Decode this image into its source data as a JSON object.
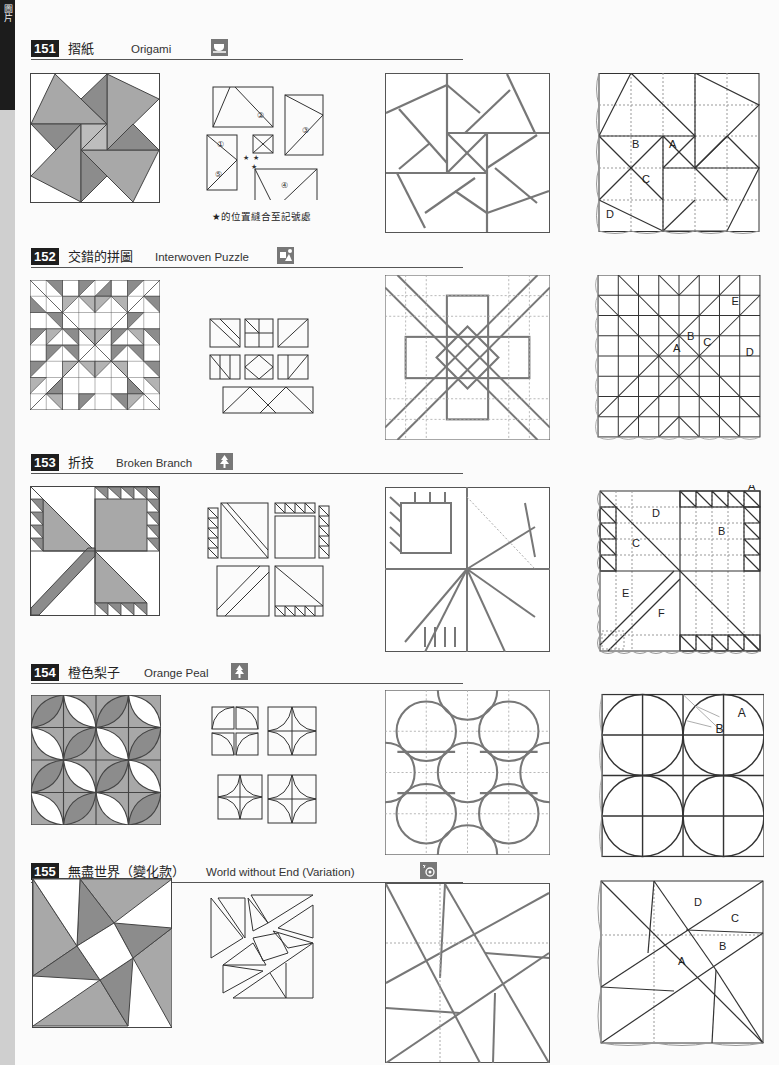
{
  "side_tab": {
    "label": "圖片"
  },
  "colors": {
    "dark_fill": "#8c8c8c",
    "mid_fill": "#a8a8a8",
    "light_fill": "#ffffff",
    "line": "#3a3a3a",
    "header_bg": "#1e1e1e",
    "icon_bg": "#777777"
  },
  "sections": [
    {
      "number": "151",
      "title_zh": "摺紙",
      "title_en": "Origami",
      "icon": "teacup-icon",
      "caption": "★的位置縫合至記號處",
      "labels": [
        "A",
        "B",
        "C",
        "D"
      ],
      "diagram_markers": [
        "①",
        "②",
        "③",
        "④",
        "⑤",
        "⑤"
      ]
    },
    {
      "number": "152",
      "title_zh": "交錯的拼圖",
      "title_en": "Interwoven Puzzle",
      "icon": "puzzle-icon",
      "labels": [
        "A",
        "B",
        "C",
        "D",
        "E"
      ]
    },
    {
      "number": "153",
      "title_zh": "折技",
      "title_en": "Broken Branch",
      "icon": "tree-icon",
      "labels": [
        "A",
        "B",
        "C",
        "D",
        "E",
        "F"
      ]
    },
    {
      "number": "154",
      "title_zh": "橙色梨子",
      "title_en": "Orange Peal",
      "icon": "tree-icon",
      "labels": [
        "A",
        "B"
      ]
    },
    {
      "number": "155",
      "title_zh": "無盡世界（變化款）",
      "title_en": "World without End (Variation)",
      "icon": "spiral-icon",
      "labels": [
        "A",
        "B",
        "C",
        "D"
      ]
    }
  ]
}
